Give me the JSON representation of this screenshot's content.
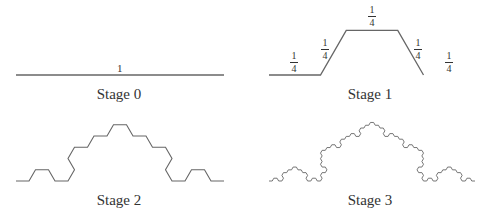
{
  "colors": {
    "curve": "#666666",
    "text": "#333333",
    "background": "#ffffff"
  },
  "generator": {
    "description": "Each segment replaced by 5 segments of 1/4 length: flat, up 60°, flat, down 60°, flat",
    "angles_deg": [
      0,
      60,
      0,
      -60,
      0
    ],
    "scale": 0.25
  },
  "stages": [
    {
      "id": 0,
      "caption": "Stage 0",
      "length_label": "1"
    },
    {
      "id": 1,
      "caption": "Stage 1",
      "segment_labels": [
        {
          "num": "1",
          "den": "4"
        },
        {
          "num": "1",
          "den": "4"
        },
        {
          "num": "1",
          "den": "4"
        },
        {
          "num": "1",
          "den": "4"
        },
        {
          "num": "1",
          "den": "4"
        }
      ]
    },
    {
      "id": 2,
      "caption": "Stage 2"
    },
    {
      "id": 3,
      "caption": "Stage 3"
    }
  ]
}
